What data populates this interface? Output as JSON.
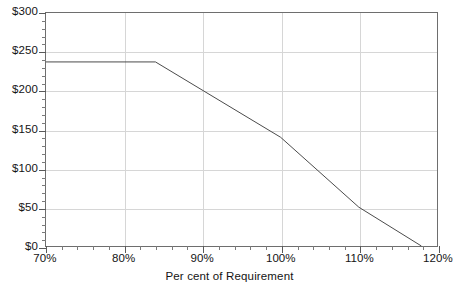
{
  "chart_data": {
    "type": "line",
    "title": "",
    "xlabel": "Per cent of Requirement",
    "ylabel": "",
    "xlim": [
      70,
      120
    ],
    "ylim": [
      0,
      300
    ],
    "grid": true,
    "legend": "none",
    "x_tick_labels": [
      "70%",
      "80%",
      "90%",
      "100%",
      "110%",
      "120%"
    ],
    "x_tick_values": [
      70,
      80,
      90,
      100,
      110,
      120
    ],
    "x_minor_interval": 2,
    "y_tick_labels": [
      "$0",
      "$50",
      "$100",
      "$150",
      "$200",
      "$250",
      "$300"
    ],
    "y_tick_values": [
      0,
      50,
      100,
      150,
      200,
      250,
      300
    ],
    "y_minor_interval": 10,
    "series": [
      {
        "name": "Price",
        "points": [
          {
            "x": 70,
            "y": 237
          },
          {
            "x": 84,
            "y": 237
          },
          {
            "x": 100,
            "y": 140
          },
          {
            "x": 110,
            "y": 50
          },
          {
            "x": 118,
            "y": 0
          }
        ]
      }
    ],
    "annotations": []
  },
  "axis": {
    "x_title": "Per cent of Requirement"
  },
  "colors": {
    "series_line": "#4a4a4a",
    "grid": "#d6d6d6",
    "frame": "#6e6e6e",
    "text": "#141414",
    "background": "#ffffff"
  }
}
